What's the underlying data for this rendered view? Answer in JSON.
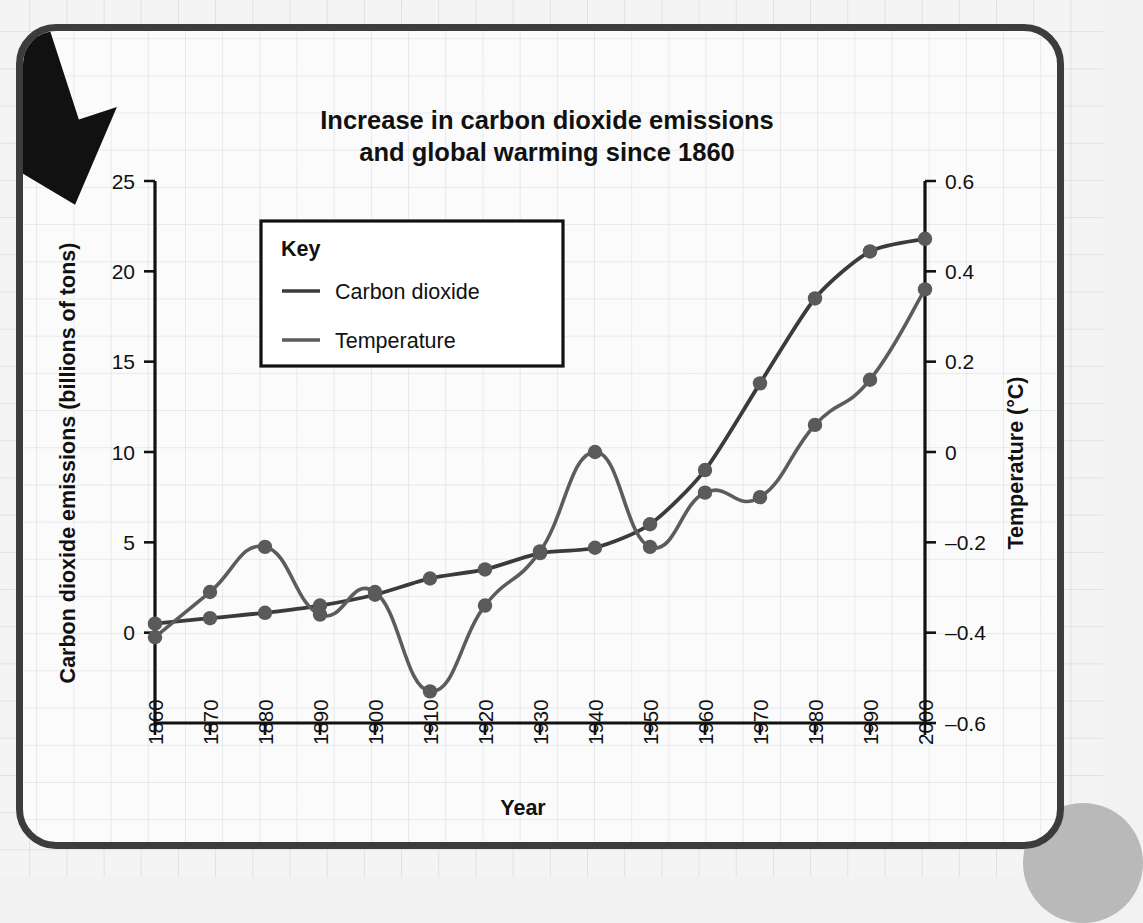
{
  "figure": {
    "title_line1": "Increase in carbon dioxide emissions",
    "title_line2": "and global warming since 1860",
    "xlabel": "Year",
    "ylabel_left": "Carbon dioxide emissions (billions of tons)",
    "ylabel_right": "Temperature (°C)",
    "legend_title": "Key",
    "arrow_icon": "left-down-arrow-icon",
    "colors": {
      "co2_line": "#3b3b3b",
      "temperature_line": "#5c5c5c",
      "marker": "#5a5a5a",
      "axis": "#111111",
      "card_border": "#3c3c3c",
      "page_background": "#f2f2f2",
      "card_background": "#fbfbfb",
      "grid": "#ced4da"
    }
  },
  "chart_data": {
    "type": "line",
    "title": "Increase in carbon dioxide emissions and global warming since 1860",
    "xlabel": "Year",
    "grid": true,
    "legend_position": "upper-left-inside",
    "x": [
      1860,
      1870,
      1880,
      1890,
      1900,
      1910,
      1920,
      1930,
      1940,
      1950,
      1960,
      1970,
      1980,
      1990,
      2000
    ],
    "xtick_labels": [
      "1860",
      "1870",
      "1880",
      "1890",
      "1900",
      "1910",
      "1920",
      "1930",
      "1940",
      "1950",
      "1960",
      "1970",
      "1980",
      "1990",
      "2000"
    ],
    "xlim": [
      1860,
      2000
    ],
    "axes": [
      {
        "id": "left",
        "label": "Carbon dioxide emissions (billions of tons)",
        "ylim": [
          -5,
          25
        ],
        "ticks": [
          0,
          5,
          10,
          15,
          20,
          25
        ],
        "tick_labels": [
          "0",
          "5",
          "10",
          "15",
          "20",
          "25"
        ]
      },
      {
        "id": "right",
        "label": "Temperature (°C)",
        "ylim": [
          -0.6,
          0.6
        ],
        "ticks": [
          -0.6,
          -0.4,
          -0.2,
          0,
          0.2,
          0.4,
          0.6
        ],
        "tick_labels": [
          "–0.6",
          "–0.4",
          "–0.2",
          "0",
          "0.2",
          "0.4",
          "0.6"
        ]
      }
    ],
    "series": [
      {
        "name": "Carbon dioxide",
        "axis": "left",
        "unit": "billions of tons",
        "color": "#3b3b3b",
        "markers": true,
        "values": [
          0.5,
          0.8,
          1.1,
          1.5,
          2.1,
          3.0,
          3.5,
          4.4,
          4.7,
          6.0,
          9.0,
          13.8,
          18.5,
          21.1,
          21.8
        ]
      },
      {
        "name": "Temperature",
        "axis": "right",
        "unit": "°C",
        "color": "#5c5c5c",
        "markers": true,
        "values": [
          -0.41,
          -0.31,
          -0.21,
          -0.36,
          -0.31,
          -0.53,
          -0.34,
          -0.22,
          0.0,
          -0.21,
          -0.09,
          -0.1,
          0.06,
          0.16,
          0.36
        ]
      }
    ],
    "legend_entries": [
      "Carbon dioxide",
      "Temperature"
    ]
  }
}
